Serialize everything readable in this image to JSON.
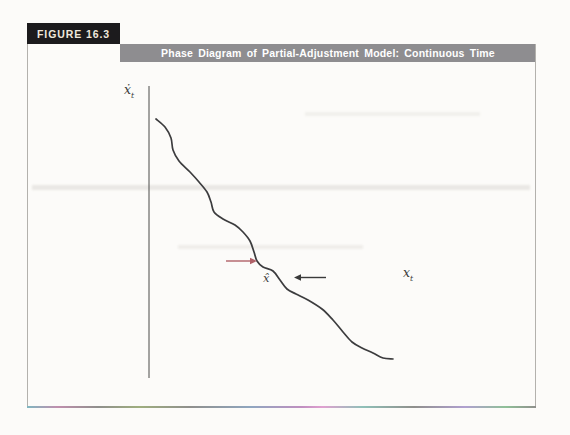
{
  "figure": {
    "label": "FIGURE 16.3",
    "title": "Phase Diagram of Partial-Adjustment Model: Continuous Time"
  },
  "axes": {
    "y_label": {
      "base": "ẋ",
      "sub": "t"
    },
    "x_label": {
      "base": "x",
      "sub": "t"
    },
    "equilibrium_label": "x̂"
  },
  "colors": {
    "background": "#fcfbf9",
    "figure_label_bg": "#1c1b1d",
    "figure_label_text": "#efe8dc",
    "title_bar_bg": "#8e8d90",
    "title_bar_text": "#ffffff",
    "border": "#b3b1ad",
    "axis_vertical": "#4a4a48",
    "axis_horizontal": "#3a3a3c",
    "curve": "#3c3c3e",
    "arrow_right": "#b06168",
    "arrow_left": "#3a3a3a"
  },
  "diagram": {
    "y_axis": {
      "x": 149,
      "y1": 86,
      "y2": 378
    },
    "x_axis": {
      "y": 269.5,
      "x1": 149,
      "x2": 419
    },
    "curve_points": [
      [
        156,
        119
      ],
      [
        165,
        127
      ],
      [
        171,
        138
      ],
      [
        173,
        150
      ],
      [
        179,
        161
      ],
      [
        190,
        172
      ],
      [
        199,
        182
      ],
      [
        207,
        192
      ],
      [
        211,
        202
      ],
      [
        214,
        212
      ],
      [
        223,
        219
      ],
      [
        235,
        225
      ],
      [
        243,
        232
      ],
      [
        250,
        241
      ],
      [
        254,
        252
      ],
      [
        257,
        261
      ],
      [
        263,
        267
      ],
      [
        273,
        271
      ],
      [
        280,
        280
      ],
      [
        287,
        289
      ],
      [
        296,
        294
      ],
      [
        308,
        300
      ],
      [
        322,
        309
      ],
      [
        333,
        320
      ],
      [
        343,
        332
      ],
      [
        352,
        342
      ],
      [
        362,
        348
      ],
      [
        373,
        353
      ],
      [
        383,
        358
      ],
      [
        393,
        359
      ]
    ],
    "arrows": [
      {
        "name": "rightward-convergence-arrow",
        "x1": 226,
        "y1": 261,
        "x2": 257,
        "y2": 261,
        "color": "#b06168"
      },
      {
        "name": "leftward-convergence-arrow",
        "x1": 326,
        "y1": 277.5,
        "x2": 294,
        "y2": 277.5,
        "color": "#3a3a3a"
      }
    ]
  }
}
